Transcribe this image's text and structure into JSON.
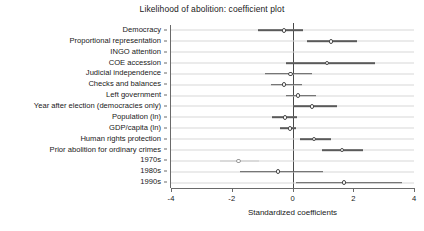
{
  "chart_data": {
    "type": "scatter",
    "title": "Likelihood of abolition: coefficient plot",
    "xlabel": "Standardized coefficients",
    "ylabel": "",
    "xlim": [
      -4,
      4
    ],
    "xticks": [
      -4,
      -2,
      0,
      2,
      4
    ],
    "xtick_labels": [
      "-4",
      "-2",
      "0",
      "2",
      "4"
    ],
    "grid": true,
    "grid_axis": "y",
    "reference_line_x": 0,
    "orientation": "horizontal",
    "categories": [
      "Democracy",
      "Proportional representation",
      "INGO attention",
      "COE accession",
      "Judicial independence",
      "Checks and balances",
      "Left government",
      "Year after election (democracies only)",
      "Population (ln)",
      "GDP/capita (ln)",
      "Human rights protection",
      "Prior abolition for ordinary crimes",
      "1970s",
      "1980s",
      "1990s"
    ],
    "points": [
      {
        "label": "Democracy",
        "estimate": -0.28,
        "ci_low": -1.14,
        "ci_high": 0.35,
        "significant": false,
        "style": "normal"
      },
      {
        "label": "Proportional representation",
        "estimate": 1.27,
        "ci_low": 0.48,
        "ci_high": 2.12,
        "significant": true,
        "style": "normal"
      },
      {
        "label": "INGO attention",
        "estimate": 0.0,
        "ci_low": 0.0,
        "ci_high": 0.0,
        "significant": false,
        "style": "hidden"
      },
      {
        "label": "COE accession",
        "estimate": 1.14,
        "ci_low": -0.21,
        "ci_high": 2.72,
        "significant": false,
        "style": "normal"
      },
      {
        "label": "Judicial independence",
        "estimate": -0.06,
        "ci_low": -0.92,
        "ci_high": 0.64,
        "significant": false,
        "style": "normal"
      },
      {
        "label": "Checks and balances",
        "estimate": -0.28,
        "ci_low": -0.71,
        "ci_high": 0.31,
        "significant": false,
        "style": "normal"
      },
      {
        "label": "Left government",
        "estimate": 0.18,
        "ci_low": -0.21,
        "ci_high": 0.77,
        "significant": false,
        "style": "normal"
      },
      {
        "label": "Year after election (democracies only)",
        "estimate": 0.64,
        "ci_low": 0.02,
        "ci_high": 1.46,
        "significant": true,
        "style": "normal"
      },
      {
        "label": "Population (ln)",
        "estimate": -0.25,
        "ci_low": -0.67,
        "ci_high": 0.15,
        "significant": false,
        "style": "normal"
      },
      {
        "label": "GDP/capita (ln)",
        "estimate": -0.08,
        "ci_low": -0.41,
        "ci_high": 0.12,
        "significant": false,
        "style": "normal"
      },
      {
        "label": "Human rights protection",
        "estimate": 0.71,
        "ci_low": 0.25,
        "ci_high": 1.27,
        "significant": true,
        "style": "normal"
      },
      {
        "label": "Prior abolition for ordinary crimes",
        "estimate": 1.63,
        "ci_low": 0.97,
        "ci_high": 2.32,
        "significant": true,
        "style": "normal"
      },
      {
        "label": "1970s",
        "estimate": -1.77,
        "ci_low": -2.4,
        "ci_high": -1.1,
        "significant": false,
        "style": "faint"
      },
      {
        "label": "1980s",
        "estimate": -0.48,
        "ci_low": -1.73,
        "ci_high": 1.0,
        "significant": false,
        "style": "normal"
      },
      {
        "label": "1990s",
        "estimate": 1.7,
        "ci_low": 0.11,
        "ci_high": 3.6,
        "significant": true,
        "style": "normal"
      }
    ],
    "colors": {
      "marker_edge": "#4a4a4a",
      "marker_fill": "#ffffff",
      "interval": "#5a5a5a",
      "interval_faint": "#c9c9c9",
      "grid": "#d8d8d8",
      "axis": "#6a6a6a",
      "reference_line": "#4a4a4a",
      "text": "#202020",
      "background": "#ffffff"
    }
  }
}
